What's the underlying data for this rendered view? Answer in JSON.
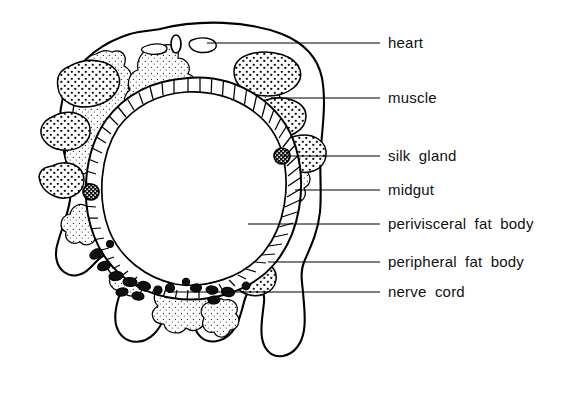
{
  "figure": {
    "background_color": "#ffffff",
    "ink_color": "#000000"
  },
  "labels": [
    {
      "id": "heart",
      "text": "heart",
      "leader_y": 43,
      "leader_x_start": 207,
      "leader_x_end": 380,
      "text_x": 388,
      "text_y": 43
    },
    {
      "id": "muscle",
      "text": "muscle",
      "leader_y": 98,
      "leader_x_start": 272,
      "leader_x_end": 380,
      "text_x": 388,
      "text_y": 98
    },
    {
      "id": "silk-gland",
      "text": "silk  gland",
      "leader_y": 156,
      "leader_x_start": 282,
      "leader_x_end": 380,
      "text_x": 388,
      "text_y": 156
    },
    {
      "id": "midgut",
      "text": "midgut",
      "leader_y": 190,
      "leader_x_start": 295,
      "leader_x_end": 380,
      "text_x": 388,
      "text_y": 190
    },
    {
      "id": "perivisceral-fat-body",
      "text": "perivisceral  fat  body",
      "leader_y": 224,
      "leader_x_start": 248,
      "leader_x_end": 380,
      "text_x": 388,
      "text_y": 224
    },
    {
      "id": "peripheral-fat-body",
      "text": "peripheral  fat  body",
      "leader_y": 262,
      "leader_x_start": 268,
      "leader_x_end": 380,
      "text_x": 388,
      "text_y": 262
    },
    {
      "id": "nerve-cord",
      "text": "nerve  cord",
      "leader_y": 292,
      "leader_x_start": 168,
      "leader_x_end": 380,
      "text_x": 388,
      "text_y": 292
    }
  ],
  "structures": {
    "body_wall": {
      "name": "body-wall-outline",
      "description": "outer cuticle outline of larval body with ventral prolegs"
    },
    "midgut": {
      "name": "midgut-ring",
      "description": "central striated gut epithelium ring"
    },
    "heart": {
      "name": "heart-vessel",
      "description": "small dorsal oval vessel"
    },
    "silk_glands": {
      "name": "silk-gland-cells",
      "count": 2,
      "description": "dark round glands with pale lumina"
    },
    "nerve_cord": {
      "name": "nerve-cord-cells",
      "description": "ventral chain of dark-filled cells"
    },
    "muscle": {
      "name": "muscle-blocks",
      "description": "dense dark-stippled muscle masses under body wall"
    },
    "perivisceral_fat_body": {
      "name": "perivisceral-fat-body-tissue",
      "description": "sparse stippled branching tissue around the gut"
    },
    "peripheral_fat_body": {
      "name": "peripheral-fat-body-tissue",
      "description": "sparse stippled lobes near the body wall"
    }
  }
}
